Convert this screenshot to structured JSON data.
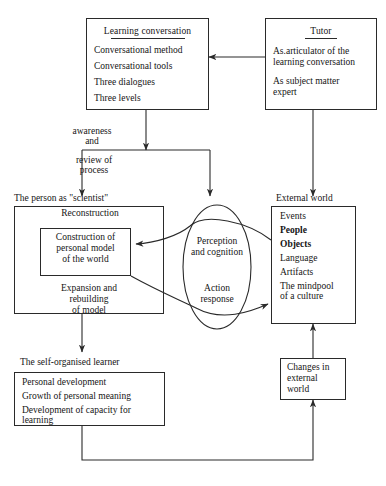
{
  "diagram": {
    "type": "flow-diagram",
    "line_color": "#2a2a2a",
    "background": "#ffffff",
    "nodes": {
      "learning_conversation": {
        "title": "Learning conversation",
        "items": [
          "Conversational method",
          "Conversational tools",
          "Three dialogues",
          "Three levels"
        ]
      },
      "tutor": {
        "title": "Tutor",
        "items": [
          "As.articulator of the",
          "learning conversation",
          "As subject matter",
          "expert"
        ]
      },
      "person_scientist": {
        "caption": "The person as \"scientist\"",
        "heading": "Reconstruction",
        "inner": [
          "Construction of",
          "personal model",
          "of the world"
        ],
        "footer": [
          "Expansion and",
          "rebuilding",
          "of model"
        ]
      },
      "external_world": {
        "caption": "External world",
        "items": [
          "Events",
          "People",
          "Objects",
          "Language",
          "Artifacts",
          "The mindpool",
          "of a culture"
        ]
      },
      "cognition_ellipse": {
        "top": [
          "Perception",
          "and cognition"
        ],
        "bottom": [
          "Action",
          "response"
        ]
      },
      "self_organised_learner": {
        "caption": "The self-organised learner",
        "items": [
          "Personal development",
          "Growth of personal meaning",
          "Development of capacity for",
          "learning"
        ]
      },
      "changes_external_world": {
        "items": [
          "Changes in",
          "external",
          "world"
        ]
      }
    },
    "edge_labels": {
      "awareness": [
        "awareness",
        "and"
      ],
      "review": [
        "review of",
        "process"
      ]
    }
  }
}
